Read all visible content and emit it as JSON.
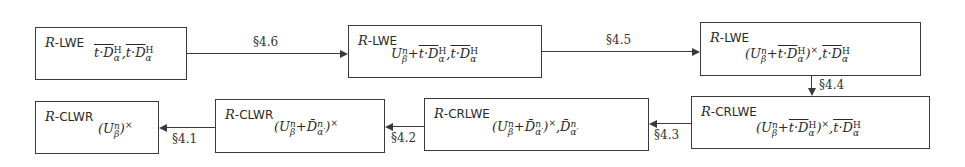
{
  "nodes": [
    {
      "id": "n1",
      "prefix": "R",
      "problem": "LWE",
      "subscript": "t·D_α^H ‾ , t·D_α^H ‾",
      "sub_parts": [
        "t·D",
        "α",
        "H",
        ",",
        "t·D",
        "α",
        "H"
      ]
    },
    {
      "id": "n2",
      "prefix": "R",
      "problem": "LWE",
      "subscript": "U_β^n + ‾t·D_α^H , ‾t·D_α^H"
    },
    {
      "id": "n3",
      "prefix": "R",
      "problem": "LWE",
      "subscript": "(U_β^n + ‾t·D_α^H)^× , ‾t·D_α^H"
    },
    {
      "id": "n4",
      "prefix": "R",
      "problem": "CRLWE",
      "subscript": "(U_β^n + ‾t·D_α^H)^× , ‾t·D_α^H"
    },
    {
      "id": "n5",
      "prefix": "R",
      "problem": "CRLWE",
      "subscript": "(U_β^n + D̄_α'^n)^× , D̄_α'^n"
    },
    {
      "id": "n6",
      "prefix": "R",
      "problem": "CLWR",
      "subscript": "(U_β^n + D̄_α'^n)^×"
    },
    {
      "id": "n7",
      "prefix": "R",
      "problem": "CLWR",
      "subscript": "(U_β^n)^×"
    }
  ],
  "edges": [
    {
      "from": "n1",
      "to": "n2",
      "label": "§4.6"
    },
    {
      "from": "n2",
      "to": "n3",
      "label": "§4.5"
    },
    {
      "from": "n3",
      "to": "n4",
      "label": "§4.4"
    },
    {
      "from": "n4",
      "to": "n5",
      "label": "§4.3"
    },
    {
      "from": "n5",
      "to": "n6",
      "label": "§4.2"
    },
    {
      "from": "n6",
      "to": "n7",
      "label": "§4.1"
    }
  ],
  "text": {
    "R": "R",
    "dash_lwe": "-LWE",
    "dash_crlwe": "-CRLWE",
    "dash_clwr": "-CLWR",
    "tD": "t·D",
    "U": "U",
    "Dbar": "D̄",
    "n": "n",
    "H": "H",
    "alpha": "α",
    "alphap": "α′",
    "beta": "β",
    "plus": "+",
    "comma": ",",
    "lparen": "(",
    "rparen": ")",
    "times": "×"
  }
}
